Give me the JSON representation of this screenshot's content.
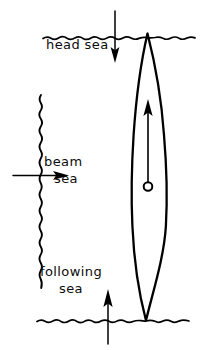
{
  "figure": {
    "ink_color": "#000000",
    "background_color": "#ffffff"
  },
  "labels": {
    "head_sea": "head sea",
    "beam_sea_line1": "beam",
    "beam_sea_line2": "sea",
    "following_sea_line1": "following",
    "following_sea_line2": "sea"
  },
  "elements": {
    "top_sea_surface": "wavy-horizontal-line",
    "bottom_sea_surface": "wavy-horizontal-line",
    "left_sea_surface": "wavy-vertical-line",
    "ship_hull": "lens-shaped-hull-outline",
    "ship_center_of_gravity": "small-circle",
    "ship_heading_arrow": "up-arrow",
    "head_sea_arrow": "down-arrow",
    "beam_sea_arrow": "right-arrow",
    "following_sea_arrow": "up-arrow"
  }
}
